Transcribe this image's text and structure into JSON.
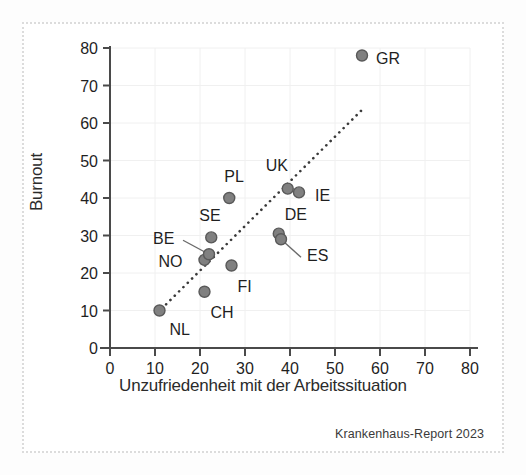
{
  "figure": {
    "source_note": "Krankenhaus-Report 2023",
    "background": "#ffffff",
    "frame_color": "#dcdcdc"
  },
  "chart_data": {
    "type": "scatter",
    "title": "",
    "xlabel": "Unzufriedenheit mit der Arbeitssituation",
    "ylabel": "Burnout",
    "xlim": [
      0,
      80
    ],
    "ylim": [
      0,
      80
    ],
    "xticks": [
      0,
      10,
      20,
      30,
      40,
      50,
      60,
      70,
      80
    ],
    "yticks": [
      0,
      10,
      20,
      30,
      40,
      50,
      60,
      70,
      80
    ],
    "xtick_labels": [
      "0",
      "10",
      "20",
      "30",
      "40",
      "50",
      "60",
      "70",
      "80"
    ],
    "ytick_labels": [
      "0",
      "10",
      "20",
      "30",
      "40",
      "50",
      "60",
      "70",
      "80"
    ],
    "grid": true,
    "grid_color": "#f0f0f0",
    "legend": null,
    "marker_color": "#808080",
    "marker_edge_color": "#595959",
    "marker_size": 11,
    "points": [
      {
        "label": "NL",
        "x": 11,
        "y": 10,
        "label_dx": 10,
        "label_dy": 24,
        "leader": false
      },
      {
        "label": "CH",
        "x": 21,
        "y": 15,
        "label_dx": 6,
        "label_dy": 26,
        "leader": false
      },
      {
        "label": "NO",
        "x": 21,
        "y": 23.5,
        "label_dx": -46,
        "label_dy": 7,
        "leader": false
      },
      {
        "label": "BE",
        "x": 22,
        "y": 25,
        "label_dx": -56,
        "label_dy": -10,
        "leader": true
      },
      {
        "label": "SE",
        "x": 22.5,
        "y": 29.5,
        "label_dx": -12,
        "label_dy": -16,
        "leader": false
      },
      {
        "label": "FI",
        "x": 27,
        "y": 22,
        "label_dx": 6,
        "label_dy": 26,
        "leader": false
      },
      {
        "label": "PL",
        "x": 26.5,
        "y": 40,
        "label_dx": -5,
        "label_dy": -16,
        "leader": false
      },
      {
        "label": "DE",
        "x": 37.5,
        "y": 30.5,
        "label_dx": 6,
        "label_dy": -14,
        "leader": false
      },
      {
        "label": "ES",
        "x": 38,
        "y": 29,
        "label_dx": 26,
        "label_dy": 22,
        "leader": true
      },
      {
        "label": "UK",
        "x": 39.5,
        "y": 42.5,
        "label_dx": -22,
        "label_dy": -18,
        "leader": false
      },
      {
        "label": "IE",
        "x": 42,
        "y": 41.5,
        "label_dx": 16,
        "label_dy": 9,
        "leader": false
      },
      {
        "label": "GR",
        "x": 56,
        "y": 78,
        "label_dx": 14,
        "label_dy": 8,
        "leader": false
      }
    ],
    "trendline": {
      "style": "dotted",
      "color": "#3a3a3a",
      "x_start": 11.5,
      "y_start": 10.5,
      "x_end": 56,
      "y_end": 63.5
    }
  }
}
